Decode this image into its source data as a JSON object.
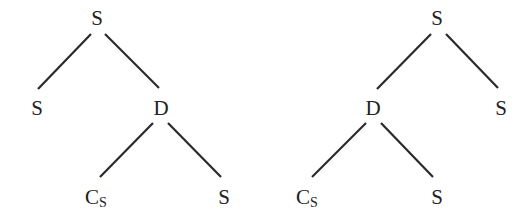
{
  "trees": [
    {
      "name": "left-tree",
      "nodes": [
        {
          "id": "root",
          "label": "S",
          "sub": "",
          "x": 97,
          "y": 18
        },
        {
          "id": "s-left",
          "label": "S",
          "sub": "",
          "x": 37,
          "y": 108
        },
        {
          "id": "d",
          "label": "D",
          "sub": "",
          "x": 161,
          "y": 108
        },
        {
          "id": "cs",
          "label": "C",
          "sub": "S",
          "x": 96,
          "y": 197
        },
        {
          "id": "s-right",
          "label": "S",
          "sub": "",
          "x": 224,
          "y": 197
        }
      ],
      "edges": [
        {
          "from": "root",
          "to": "s-left",
          "x1": 91,
          "y1": 34,
          "x2": 38,
          "y2": 89
        },
        {
          "from": "root",
          "to": "d",
          "x1": 105,
          "y1": 34,
          "x2": 159,
          "y2": 88
        },
        {
          "from": "d",
          "to": "cs",
          "x1": 153,
          "y1": 123,
          "x2": 100,
          "y2": 177
        },
        {
          "from": "d",
          "to": "s-right",
          "x1": 168,
          "y1": 123,
          "x2": 221,
          "y2": 177
        }
      ]
    },
    {
      "name": "right-tree",
      "nodes": [
        {
          "id": "root",
          "label": "S",
          "sub": "",
          "x": 437,
          "y": 18
        },
        {
          "id": "d",
          "label": "D",
          "sub": "",
          "x": 373,
          "y": 108
        },
        {
          "id": "s-right",
          "label": "S",
          "sub": "",
          "x": 501,
          "y": 108
        },
        {
          "id": "cs",
          "label": "C",
          "sub": "S",
          "x": 307,
          "y": 197
        },
        {
          "id": "s-mid",
          "label": "S",
          "sub": "",
          "x": 437,
          "y": 197
        }
      ],
      "edges": [
        {
          "from": "root",
          "to": "d",
          "x1": 431,
          "y1": 34,
          "x2": 377,
          "y2": 89
        },
        {
          "from": "root",
          "to": "s-right",
          "x1": 446,
          "y1": 34,
          "x2": 498,
          "y2": 88
        },
        {
          "from": "d",
          "to": "cs",
          "x1": 366,
          "y1": 123,
          "x2": 312,
          "y2": 177
        },
        {
          "from": "d",
          "to": "s-mid",
          "x1": 381,
          "y1": 123,
          "x2": 433,
          "y2": 177
        }
      ]
    }
  ]
}
